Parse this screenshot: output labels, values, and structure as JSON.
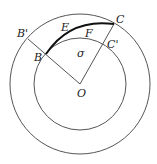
{
  "diagram": {
    "center": {
      "x": 80,
      "y": 84
    },
    "outer_radius": 70,
    "inner_radius": 46,
    "stroke_color": "#555555",
    "arc_color": "#111111",
    "labels": {
      "B_prime": "B'",
      "B": "B",
      "E": "E",
      "F": "F",
      "C": "C",
      "C_prime": "C'",
      "sigma": "σ",
      "O": "O"
    }
  }
}
